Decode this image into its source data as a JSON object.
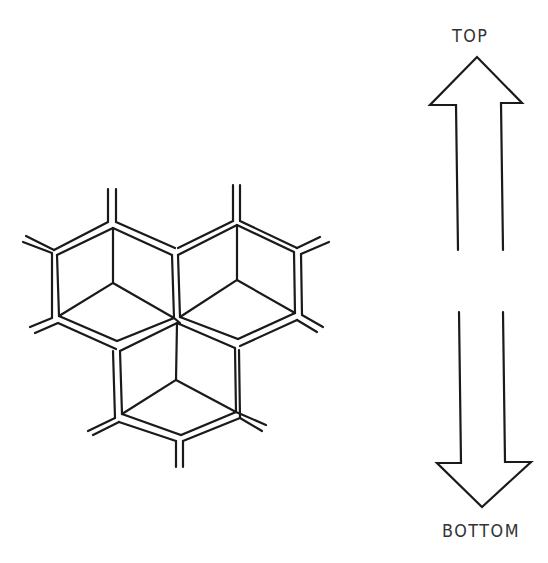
{
  "diagram": {
    "type": "honeycomb-orientation",
    "colors": {
      "line": "#1a1a1a",
      "background": "#ffffff",
      "text": "#333333"
    },
    "cells": [
      {
        "name": "upper-left-cell"
      },
      {
        "name": "upper-right-cell"
      },
      {
        "name": "bottom-cell"
      }
    ],
    "labels": {
      "top": "TOP",
      "bottom": "BOTTOM"
    },
    "arrows": [
      {
        "direction": "up",
        "label": "TOP"
      },
      {
        "direction": "down",
        "label": "BOTTOM"
      }
    ]
  }
}
